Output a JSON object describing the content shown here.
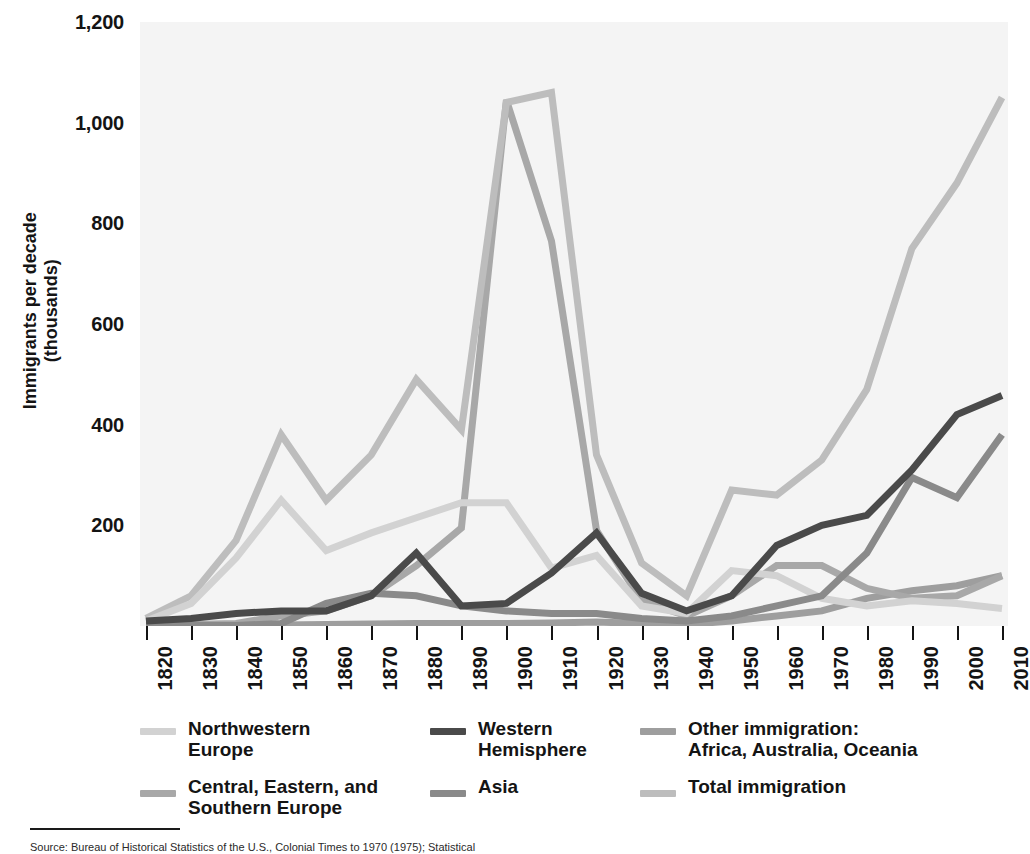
{
  "axes": {
    "y_title": "Immigrants per decade\n(thousands)",
    "y_ticks": [
      "1,200",
      "1,000",
      "800",
      "600",
      "400",
      "200"
    ],
    "y_tick_values": [
      1200,
      1000,
      800,
      600,
      400,
      200
    ],
    "x_ticks": [
      "1820",
      "1830",
      "1840",
      "1850",
      "1860",
      "1870",
      "1880",
      "1890",
      "1900",
      "1910",
      "1920",
      "1930",
      "1940",
      "1950",
      "1960",
      "1970",
      "1980",
      "1990",
      "2000",
      "2010"
    ]
  },
  "legend": {
    "columns": [
      {
        "entries": [
          {
            "label": "Northwestern\nEurope",
            "color": "#d2d2d2",
            "series": "northwestern_europe"
          },
          {
            "label": "Central, Eastern, and\nSouthern Europe",
            "color": "#a8a8a8",
            "series": "central_eastern_southern_europe"
          }
        ]
      },
      {
        "entries": [
          {
            "label": "Western\nHemisphere",
            "color": "#4a4a4a",
            "series": "western_hemisphere"
          },
          {
            "label": "Asia",
            "color": "#8a8a8a",
            "series": "asia"
          }
        ]
      },
      {
        "entries": [
          {
            "label": "Other immigration:\nAfrica, Australia, Oceania",
            "color": "#9e9e9e",
            "series": "other_immigration"
          },
          {
            "label": "Total immigration",
            "color": "#bdbdbd",
            "series": "total_immigration"
          }
        ]
      }
    ]
  },
  "source": {
    "rule": true,
    "text": "Source: Bureau of Historical Statistics of the U.S., Colonial Times to 1970 (1975); Statistical"
  },
  "chart_data": {
    "type": "line",
    "title": "",
    "xlabel": "",
    "ylabel": "Immigrants per decade (thousands)",
    "xlim": [
      1820,
      2010
    ],
    "ylim": [
      0,
      1200
    ],
    "grid": false,
    "legend_position": "bottom",
    "x": [
      1820,
      1830,
      1840,
      1850,
      1860,
      1870,
      1880,
      1890,
      1900,
      1910,
      1920,
      1930,
      1940,
      1950,
      1960,
      1970,
      1980,
      1990,
      2000,
      2010
    ],
    "series": [
      {
        "name": "Northwestern Europe",
        "color": "#d2d2d2",
        "values": [
          10,
          45,
          135,
          250,
          150,
          185,
          215,
          245,
          245,
          115,
          140,
          40,
          25,
          110,
          100,
          55,
          40,
          50,
          45,
          35
        ]
      },
      {
        "name": "Central, Eastern, and Southern Europe",
        "color": "#a8a8a8",
        "values": [
          2,
          3,
          5,
          20,
          30,
          60,
          120,
          195,
          1045,
          765,
          190,
          50,
          20,
          60,
          120,
          120,
          75,
          55,
          60,
          100
        ]
      },
      {
        "name": "Western Hemisphere",
        "color": "#4a4a4a",
        "values": [
          10,
          15,
          25,
          30,
          30,
          60,
          145,
          40,
          45,
          105,
          185,
          65,
          30,
          60,
          160,
          200,
          220,
          310,
          420,
          458
        ]
      },
      {
        "name": "Asia",
        "color": "#8a8a8a",
        "values": [
          1,
          1,
          1,
          5,
          45,
          65,
          60,
          40,
          30,
          25,
          25,
          15,
          10,
          20,
          40,
          60,
          145,
          295,
          255,
          380
        ]
      },
      {
        "name": "Other immigration: Africa, Australia, Oceania",
        "color": "#9e9e9e",
        "values": [
          1,
          1,
          1,
          2,
          3,
          4,
          5,
          5,
          5,
          6,
          8,
          5,
          3,
          10,
          20,
          30,
          55,
          70,
          80,
          100
        ]
      },
      {
        "name": "Total immigration",
        "color": "#bdbdbd",
        "values": [
          15,
          60,
          170,
          380,
          250,
          340,
          490,
          390,
          1040,
          1060,
          340,
          125,
          60,
          270,
          260,
          330,
          470,
          750,
          880,
          1050
        ]
      }
    ]
  }
}
